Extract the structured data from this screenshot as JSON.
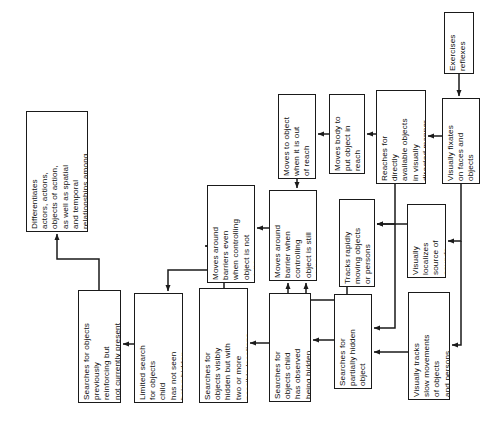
{
  "diagram": {
    "orientation": "rotated-90",
    "background_color": "#ffffff",
    "line_color": "#1a1a1a",
    "box_border_color": "#1a1a1a",
    "box_fill_color": "#ffffff",
    "text_color": "#0d0d0d",
    "nodes": [
      {
        "id": "differentiates",
        "label": "Differentiates\nactors, actions,\nobjects of action,\nas well as spatial\nand temporal\nrelationships among\nthese",
        "x": 26,
        "y": 111,
        "w": 62,
        "h": 121
      },
      {
        "id": "searches-previously-reinforcing",
        "label": "Searches for objects\npreviously\nreinforcing but\nnot currently present",
        "x": 78,
        "y": 290,
        "w": 43,
        "h": 113
      },
      {
        "id": "limited-search",
        "label": "Limited search\nfor objects\nchild\nhas not seen\nbeing hidden",
        "x": 134,
        "y": 293,
        "w": 49,
        "h": 110
      },
      {
        "id": "searches-visibly-hidden-two-locations",
        "label": "Searches for\nobjects visibly\nhidden but with\ntwo or more\npossible locations",
        "x": 199,
        "y": 288,
        "w": 49,
        "h": 115
      },
      {
        "id": "searches-observed-hidden",
        "label": "Searches for\nobjects child\nhas observed\nbeing hidden",
        "x": 269,
        "y": 293,
        "w": 42,
        "h": 109
      },
      {
        "id": "searches-partially-hidden",
        "label": "Searches for\npartially hidden\nobject",
        "x": 334,
        "y": 294,
        "w": 38,
        "h": 95
      },
      {
        "id": "visually-tracks-slow",
        "label": "Visually tracks\nslow movements\nof objects\nand persons",
        "x": 408,
        "y": 292,
        "w": 42,
        "h": 108
      },
      {
        "id": "moves-around-barriers-not-visible",
        "label": "Moves around\nbarriers even\nwhen controlling\nobject is not\nvisible",
        "x": 207,
        "y": 185,
        "w": 48,
        "h": 98
      },
      {
        "id": "moves-around-barrier-still-visible",
        "label": "Moves around\nbarrier when\ncontrolling\nobject is still\nvisible",
        "x": 269,
        "y": 190,
        "w": 48,
        "h": 91
      },
      {
        "id": "tracks-rapidly-moving",
        "label": "Tracks rapidly\nmoving objects\nor persons",
        "x": 339,
        "y": 199,
        "w": 36,
        "h": 88
      },
      {
        "id": "visually-localizes-sounds",
        "label": "Visually\nlocalizes\nsource of\nsounds",
        "x": 407,
        "y": 204,
        "w": 39,
        "h": 74
      },
      {
        "id": "moves-to-object-out-of-reach",
        "label": "Moves to object\nwhen it is out\nof reach",
        "x": 278,
        "y": 94,
        "w": 38,
        "h": 85
      },
      {
        "id": "moves-body-put-object-in-reach",
        "label": "Moves body to\nput object in\nreach",
        "x": 329,
        "y": 94,
        "w": 36,
        "h": 80
      },
      {
        "id": "reaches-for-directly-available",
        "label": "Reaches for\ndirectly\navailable objects\nin visually\ndirected manner",
        "x": 376,
        "y": 90,
        "w": 50,
        "h": 94
      },
      {
        "id": "visually-fixates-faces",
        "label": "Visually fixates\non faces and\nobjects",
        "x": 442,
        "y": 98,
        "w": 38,
        "h": 86
      },
      {
        "id": "exercises-reflexes",
        "label": "Exercises\nreflexes",
        "x": 444,
        "y": 12,
        "w": 30,
        "h": 62
      }
    ],
    "edges": [
      {
        "from": "exercises-reflexes",
        "to": "visually-fixates-faces"
      },
      {
        "from": "visually-fixates-faces",
        "to": "reaches-for-directly-available"
      },
      {
        "from": "visually-fixates-faces",
        "to": "visually-localizes-sounds"
      },
      {
        "from": "visually-fixates-faces",
        "to": "visually-tracks-slow"
      },
      {
        "from": "reaches-for-directly-available",
        "to": "moves-body-put-object-in-reach"
      },
      {
        "from": "reaches-for-directly-available",
        "to": "tracks-rapidly-moving"
      },
      {
        "from": "reaches-for-directly-available",
        "to": "searches-partially-hidden"
      },
      {
        "from": "moves-body-put-object-in-reach",
        "to": "moves-to-object-out-of-reach"
      },
      {
        "from": "moves-to-object-out-of-reach",
        "to": "moves-around-barrier-still-visible"
      },
      {
        "from": "visually-localizes-sounds",
        "to": "tracks-rapidly-moving"
      },
      {
        "from": "visually-tracks-slow",
        "to": "searches-partially-hidden"
      },
      {
        "from": "tracks-rapidly-moving",
        "to": "moves-around-barrier-still-visible"
      },
      {
        "from": "searches-partially-hidden",
        "to": "searches-observed-hidden"
      },
      {
        "from": "searches-observed-hidden",
        "to": "moves-around-barrier-still-visible"
      },
      {
        "from": "searches-observed-hidden",
        "to": "searches-visibly-hidden-two-locations"
      },
      {
        "from": "searches-visibly-hidden-two-locations",
        "to": "moves-around-barriers-not-visible"
      },
      {
        "from": "searches-visibly-hidden-two-locations",
        "to": "limited-search"
      },
      {
        "from": "moves-around-barrier-still-visible",
        "to": "moves-around-barriers-not-visible"
      },
      {
        "from": "limited-search",
        "to": "searches-previously-reinforcing"
      },
      {
        "from": "searches-previously-reinforcing",
        "to": "differentiates"
      }
    ]
  }
}
